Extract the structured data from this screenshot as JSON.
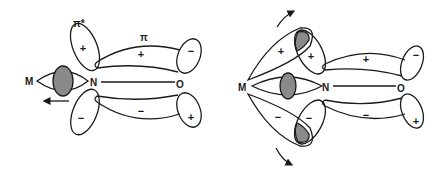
{
  "diagram": {
    "left_panel": {
      "atoms": {
        "metal": "M",
        "nitrogen": "N",
        "oxygen": "O"
      },
      "orbital_labels": {
        "antibonding": "π*",
        "bonding": "π"
      },
      "signs": {
        "n_upper_lobe": "+",
        "pi_upper_lobe": "+",
        "o_upper_lobe": "−",
        "n_lower_lobe": "−",
        "pi_lower_lobe": "−",
        "o_lower_lobe": "+"
      },
      "arrow_direction": "left"
    },
    "right_panel": {
      "atoms": {
        "metal": "M",
        "nitrogen": "N",
        "oxygen": "O"
      },
      "signs": {
        "m_upper_lobe": "+",
        "n_upper_lobe": "+",
        "pi_upper_lobe": "+",
        "o_upper_lobe": "−",
        "m_lower_lobe": "−",
        "n_lower_lobe": "−",
        "pi_lower_lobe": "−",
        "o_lower_lobe": "+"
      },
      "arrows": [
        "rotate-up",
        "rotate-down"
      ]
    },
    "colors": {
      "line": "#1a1a1a",
      "shading": "#8a8a8a",
      "background": "#ffffff"
    }
  }
}
